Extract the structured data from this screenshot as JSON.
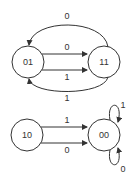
{
  "diagram": {
    "type": "state-transition",
    "nodes": [
      {
        "id": "01",
        "label": "01"
      },
      {
        "id": "11",
        "label": "11"
      },
      {
        "id": "10",
        "label": "10"
      },
      {
        "id": "00",
        "label": "00"
      }
    ],
    "edges": [
      {
        "from": "11",
        "to": "01",
        "label": "0",
        "route": "top-arc"
      },
      {
        "from": "01",
        "to": "11",
        "label": "0",
        "route": "upper-straight"
      },
      {
        "from": "01",
        "to": "11",
        "label": "1",
        "route": "lower-straight"
      },
      {
        "from": "11",
        "to": "01",
        "label": "1",
        "route": "bottom-arc"
      },
      {
        "from": "10",
        "to": "00",
        "label": "1",
        "route": "upper-straight"
      },
      {
        "from": "10",
        "to": "00",
        "label": "0",
        "route": "lower-straight"
      },
      {
        "from": "00",
        "to": "00",
        "label": "1",
        "route": "self-loop-top"
      },
      {
        "from": "00",
        "to": "00",
        "label": "0",
        "route": "self-loop-bottom"
      }
    ],
    "colors": {
      "stroke": "#333333",
      "fill": "#ffffff"
    }
  }
}
